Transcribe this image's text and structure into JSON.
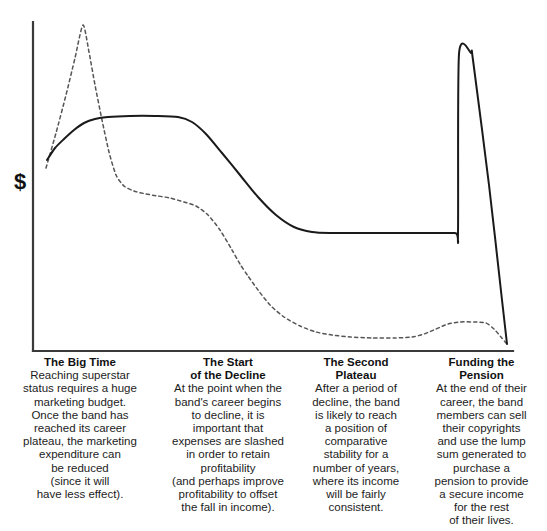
{
  "figure": {
    "y_axis_label": "$",
    "background_color": "#ffffff",
    "line_color": "#1a1a1a"
  },
  "captions": [
    {
      "title": "The Big Time",
      "body": "Reaching superstar\nstatus requires a huge\nmarketing budget.\nOnce the band has\nreached its career\nplateau, the marketing\nexpenditure can\nbe reduced\n(since it will\nhave less effect)."
    },
    {
      "title": "The Start\nof the Decline",
      "body": "At the point when the\nband's career begins\nto decline, it is\nimportant that\nexpenses are slashed\nin order to retain\nprofitability\n(and perhaps improve\nprofitability to offset\nthe fall in income)."
    },
    {
      "title": "The Second\nPlateau",
      "body": "After a period of\ndecline, the band\nis likely to reach\na position of\ncomparative\nstability for a\nnumber of years,\nwhere its income\nwill be fairly\nconsistent."
    },
    {
      "title": "Funding the\nPension",
      "body": "At the end of their\ncareer, the band\nmembers can sell\ntheir copyrights\nand use the lump\nsum generated to\npurchase a\npension to provide\na secure income\nfor the rest\nof their lives."
    }
  ],
  "chart_data": {
    "type": "line",
    "title": "",
    "xlabel": "",
    "ylabel": "$",
    "grid": false,
    "legend": "none",
    "axis": {
      "y_axis_x_px": 33,
      "y_axis_top_px": 22,
      "x_axis_y_px": 351,
      "x_axis_right_px": 513,
      "note": "axis pixel geometry; y increases downward in screen space"
    },
    "series": [
      {
        "name": "Income",
        "style": "solid",
        "color": "#1a1a1a",
        "description": "Band income: rises to a career plateau, declines to a second plateau, then spikes sharply at copyright sale before dropping to zero.",
        "points_px": [
          [
            47,
            160
          ],
          [
            55,
            148
          ],
          [
            64,
            139
          ],
          [
            74,
            130
          ],
          [
            84,
            123
          ],
          [
            95,
            119
          ],
          [
            108,
            117
          ],
          [
            130,
            116
          ],
          [
            155,
            116
          ],
          [
            178,
            117
          ],
          [
            192,
            122
          ],
          [
            206,
            134
          ],
          [
            222,
            153
          ],
          [
            240,
            175
          ],
          [
            258,
            197
          ],
          [
            276,
            215
          ],
          [
            294,
            227
          ],
          [
            312,
            232
          ],
          [
            330,
            233
          ],
          [
            370,
            233
          ],
          [
            420,
            233
          ],
          [
            455,
            233
          ],
          [
            458,
            233
          ],
          [
            459,
            54
          ],
          [
            471,
            53
          ],
          [
            473,
            60
          ],
          [
            489,
            185
          ],
          [
            502,
            300
          ],
          [
            507,
            344
          ]
        ]
      },
      {
        "name": "Marketing expenditure",
        "style": "dashed",
        "color": "#555555",
        "description": "Marketing spend: huge launch spike, slashed sharply, gradual decline to a low flat level, with a small late bump.",
        "points_px": [
          [
            46,
            168
          ],
          [
            56,
            133
          ],
          [
            66,
            95
          ],
          [
            75,
            58
          ],
          [
            83,
            25
          ],
          [
            89,
            52
          ],
          [
            95,
            85
          ],
          [
            102,
            120
          ],
          [
            109,
            152
          ],
          [
            116,
            175
          ],
          [
            124,
            186
          ],
          [
            134,
            191
          ],
          [
            146,
            194
          ],
          [
            158,
            196
          ],
          [
            170,
            198
          ],
          [
            184,
            202
          ],
          [
            196,
            206
          ],
          [
            208,
            215
          ],
          [
            220,
            230
          ],
          [
            232,
            250
          ],
          [
            240,
            264
          ],
          [
            248,
            276
          ],
          [
            258,
            290
          ],
          [
            270,
            305
          ],
          [
            284,
            317
          ],
          [
            300,
            326
          ],
          [
            316,
            332
          ],
          [
            332,
            335
          ],
          [
            350,
            337
          ],
          [
            372,
            338
          ],
          [
            394,
            338
          ],
          [
            412,
            337
          ],
          [
            424,
            334
          ],
          [
            436,
            329
          ],
          [
            448,
            324
          ],
          [
            460,
            322
          ],
          [
            474,
            322
          ],
          [
            486,
            323
          ],
          [
            494,
            329
          ],
          [
            501,
            337
          ],
          [
            506,
            343
          ]
        ]
      }
    ]
  }
}
